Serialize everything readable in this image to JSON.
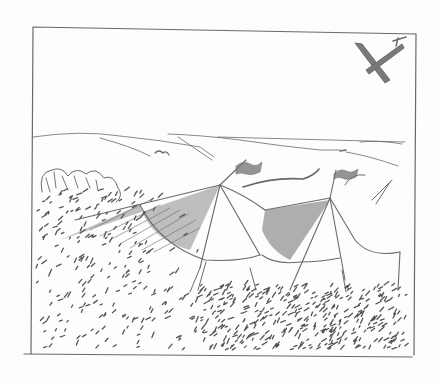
{
  "artwork": {
    "type": "pen-and-ink sketch",
    "subject": "circus tents in a grassy field with rolling hills and an airplane in the sky",
    "colors": {
      "paper": "#fdfdfd",
      "ink": "#6a6a6a",
      "shade": "#7a7a7a"
    },
    "frame": {
      "x": 32,
      "y": 27,
      "width": 384,
      "height": 322
    }
  }
}
